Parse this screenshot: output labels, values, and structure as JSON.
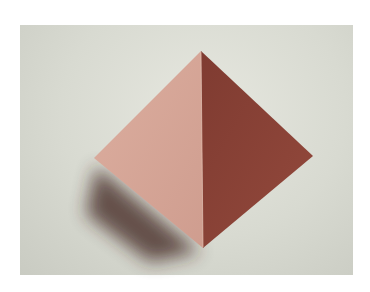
{
  "image": {
    "subject": "origami-pyramid",
    "description": "Folded paper pyramid seen from above on a pale grey background",
    "colors": {
      "background": "#d9dbd2",
      "light_face": "#d4a395",
      "dark_face": "#8a4438",
      "shadow": "#4a2a26",
      "page": "#ffffff"
    }
  }
}
